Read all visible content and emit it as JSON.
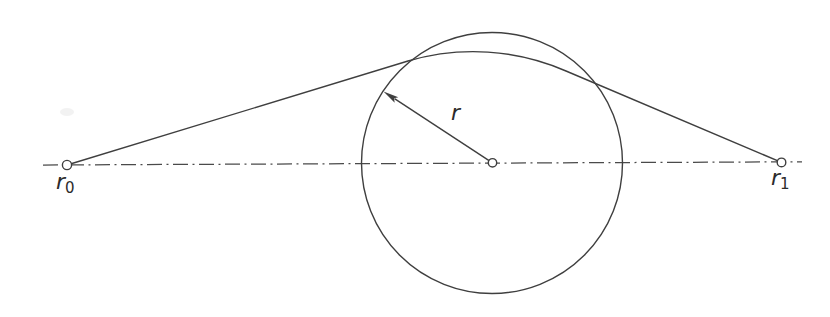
{
  "figure": {
    "background": "#ffffff",
    "stroke_color": "#3f3f3f",
    "centerline_color": "#4a4a4a",
    "text_color": "#2b2b2b",
    "labels": {
      "r0": {
        "base": "r",
        "sub": "0"
      },
      "r1": {
        "base": "r",
        "sub": "1"
      },
      "radius": "r"
    },
    "geometry": {
      "canvas": {
        "width": 830,
        "height": 317
      },
      "circle": {
        "cx": 492,
        "cy": 163,
        "r": 130.5,
        "stroke_width": 1.4
      },
      "centerline": {
        "x1": 43,
        "y1": 165,
        "x2": 802,
        "y2": 161.8,
        "dash": "15 4.5 2 4.5",
        "stroke_width": 1.25
      },
      "tangent_path": {
        "d": "M 67 165 L 408 61 A 232 232 0 0 1 566 71 L 781.5 162.4",
        "stroke_width": 1.4
      },
      "radius_arrow": {
        "shaft": {
          "x1": 492.5,
          "y1": 162.8,
          "x2": 394.5,
          "y2": 98.6,
          "stroke_width": 1.4
        },
        "head_points": "383.5,91.5 398.3,97.2 394.0,98.3 394.7,102.8"
      },
      "markers": {
        "r0": {
          "cx": 67,
          "cy": 165,
          "r": 4.6,
          "stroke_width": 1.4
        },
        "center": {
          "cx": 492.5,
          "cy": 162.8,
          "r": 4.2,
          "stroke_width": 1.4
        },
        "r1": {
          "cx": 781.5,
          "cy": 162.4,
          "r": 4.3,
          "stroke_width": 1.4
        }
      },
      "label_pos": {
        "r0": {
          "x": 56,
          "y": 189
        },
        "r1": {
          "x": 771,
          "y": 185
        },
        "radius": {
          "x": 451,
          "y": 120
        }
      },
      "smudge": {
        "cx": 67,
        "cy": 112,
        "rx": 7,
        "ry": 4
      }
    }
  }
}
